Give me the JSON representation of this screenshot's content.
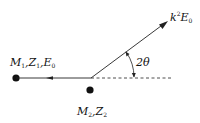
{
  "diagram": {
    "incident_particle": {
      "label_M": "M",
      "label_M_sub": "1",
      "label_Z": "Z",
      "label_Z_sub": "1",
      "label_E": "E",
      "label_E_sub": "0"
    },
    "target_particle": {
      "label_M": "M",
      "label_M_sub": "2",
      "label_Z": "Z",
      "label_Z_sub": "2"
    },
    "scattered": {
      "label_k": "k",
      "label_k_sup": "2",
      "label_E": "E",
      "label_E_sub": "0"
    },
    "angle": {
      "label": "2θ"
    },
    "separator": ","
  }
}
